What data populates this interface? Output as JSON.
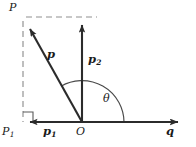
{
  "figure": {
    "type": "vector-decomposition-diagram",
    "stroke_color": "#2b2b2b",
    "dash_color": "#8a8a8a",
    "arc_color": "#4a4a4a",
    "background": "#ffffff"
  },
  "labels": {
    "point_p": "P",
    "point_p1_base": "P",
    "point_p1_sub": "1",
    "origin": "O",
    "vector_p": "p",
    "vector_p1_base": "p",
    "vector_p1_sub": "1",
    "vector_p2_base": "p",
    "vector_p2_sub": "2",
    "axis_q": "q",
    "angle": "θ"
  },
  "geometry": {
    "origin": {
      "x": 82,
      "y": 122
    },
    "point_p": {
      "x": 24,
      "y": 20
    },
    "p2_tip": {
      "x": 97,
      "y": 17
    },
    "p1_tip": {
      "x": 23,
      "y": 122
    },
    "q_tip": {
      "x": 186,
      "y": 122
    },
    "arc_radius": 42,
    "angle_degrees": 120
  }
}
